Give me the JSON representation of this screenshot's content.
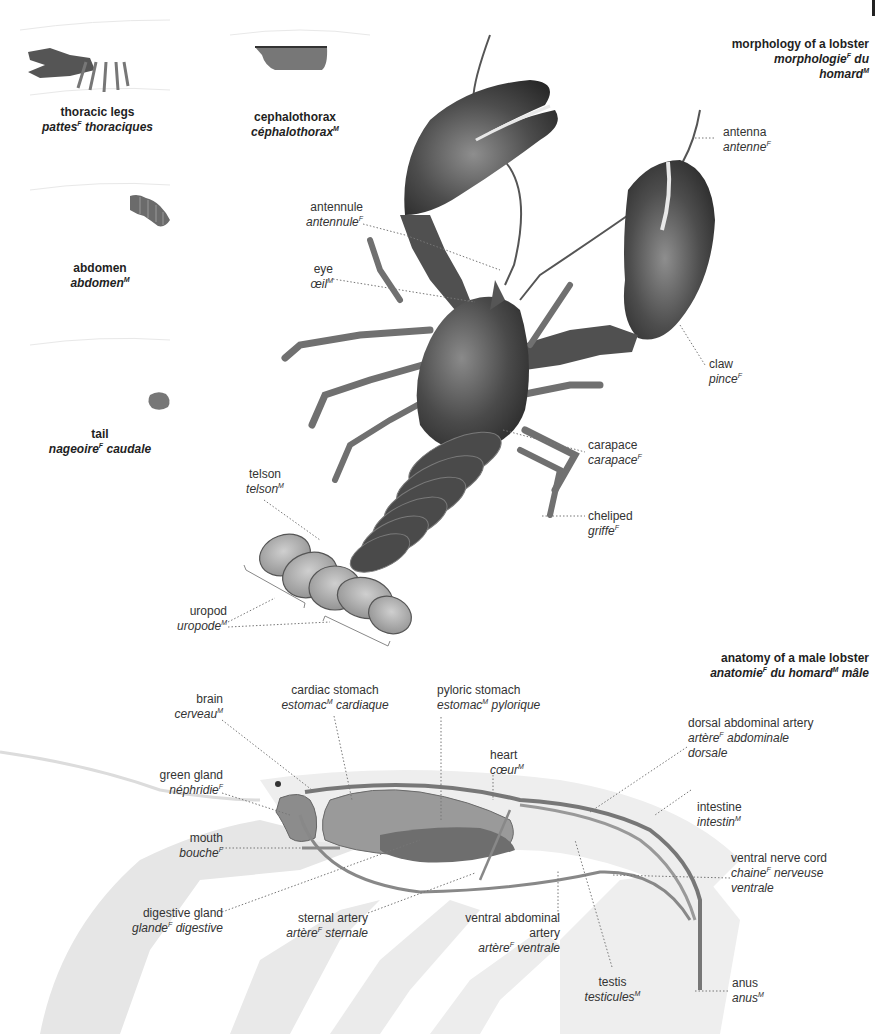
{
  "sections": {
    "morphology": {
      "title_en": "morphology of a lobster",
      "title_fr_1": "morphologie",
      "title_fr_1_gender": "F",
      "title_fr_1_rest": " du",
      "title_fr_2": "homard",
      "title_fr_2_gender": "M"
    },
    "anatomy": {
      "title_en": "anatomy of a male lobster",
      "title_fr_a": "anatomie",
      "title_fr_a_gender": "F",
      "title_fr_b": " du homard",
      "title_fr_b_gender": "M",
      "title_fr_c": " mâle"
    }
  },
  "thumbnails": [
    {
      "en": "thoracic legs",
      "fr": "pattes",
      "gender": "F",
      "fr_rest": " thoraciques"
    },
    {
      "en": "cephalothorax",
      "fr": "céphalothorax",
      "gender": "M",
      "fr_rest": ""
    },
    {
      "en": "abdomen",
      "fr": "abdomen",
      "gender": "M",
      "fr_rest": ""
    },
    {
      "en": "tail",
      "fr": "nageoire",
      "gender": "F",
      "fr_rest": " caudale"
    }
  ],
  "morphology_labels": [
    {
      "en": "antenna",
      "fr": "antenne",
      "gender": "F",
      "fr_rest": ""
    },
    {
      "en": "antennule",
      "fr": "antennule",
      "gender": "F",
      "fr_rest": ""
    },
    {
      "en": "eye",
      "fr": "œil",
      "gender": "M",
      "fr_rest": ""
    },
    {
      "en": "claw",
      "fr": "pince",
      "gender": "F",
      "fr_rest": ""
    },
    {
      "en": "carapace",
      "fr": "carapace",
      "gender": "F",
      "fr_rest": ""
    },
    {
      "en": "cheliped",
      "fr": "griffe",
      "gender": "F",
      "fr_rest": ""
    },
    {
      "en": "telson",
      "fr": "telson",
      "gender": "M",
      "fr_rest": ""
    },
    {
      "en": "uropod",
      "fr": "uropode",
      "gender": "M",
      "fr_rest": ""
    }
  ],
  "anatomy_labels": [
    {
      "en": "brain",
      "fr": "cerveau",
      "gender": "M",
      "fr_rest": ""
    },
    {
      "en": "cardiac stomach",
      "fr": "estomac",
      "gender": "M",
      "fr_rest": " cardiaque"
    },
    {
      "en": "pyloric stomach",
      "fr": "estomac",
      "gender": "M",
      "fr_rest": " pylorique"
    },
    {
      "en": "heart",
      "fr": "cœur",
      "gender": "M",
      "fr_rest": ""
    },
    {
      "en": "dorsal abdominal artery",
      "fr": "artère",
      "gender": "F",
      "fr_rest": " abdominale",
      "fr_line3": "dorsale"
    },
    {
      "en": "green gland",
      "fr": "néphridie",
      "gender": "F",
      "fr_rest": ""
    },
    {
      "en": "intestine",
      "fr": "intestin",
      "gender": "M",
      "fr_rest": ""
    },
    {
      "en": "mouth",
      "fr": "bouche",
      "gender": "F",
      "fr_rest": ""
    },
    {
      "en": "ventral nerve cord",
      "fr": "chaine",
      "gender": "F",
      "fr_rest": " nerveuse",
      "fr_line3": "ventrale"
    },
    {
      "en": "digestive gland",
      "fr": "glande",
      "gender": "F",
      "fr_rest": " digestive"
    },
    {
      "en": "sternal artery",
      "fr": "artère",
      "gender": "F",
      "fr_rest": " sternale"
    },
    {
      "en": "ventral abdominal",
      "en_line2": "artery",
      "fr": "artère",
      "gender": "F",
      "fr_rest": " ventrale"
    },
    {
      "en": "testis",
      "fr": "testicules",
      "gender": "M",
      "fr_rest": ""
    },
    {
      "en": "anus",
      "fr": "anus",
      "gender": "M",
      "fr_rest": ""
    }
  ],
  "colors": {
    "ink_dark": "#2b2b2b",
    "shell_mid": "#6e6e6e",
    "organ_fill": "#9a9a9a",
    "ghost_body": "#e6e6e6",
    "leader": "#777777"
  }
}
